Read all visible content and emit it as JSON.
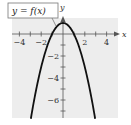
{
  "chart_data": {
    "type": "line",
    "title": "",
    "function_label": "y = f(x)",
    "xlabel": "x",
    "ylabel": "y",
    "xlim": [
      -4.5,
      4.5
    ],
    "ylim": [
      -7.5,
      1.5
    ],
    "x_ticks": [
      -4,
      -3,
      -2,
      -1,
      1,
      2,
      3,
      4
    ],
    "x_tick_labels": [
      "-4",
      "-2",
      "2",
      "4"
    ],
    "x_tick_label_values": [
      -4,
      -2,
      2,
      4
    ],
    "y_ticks": [
      -7,
      -6,
      -5,
      -4,
      -3,
      -2,
      -1,
      1
    ],
    "y_tick_labels": [
      "-2",
      "-4",
      "-6"
    ],
    "y_tick_label_values": [
      -2,
      -4,
      -6
    ],
    "grid": false,
    "series": [
      {
        "name": "y = f(x)",
        "description": "downward-opening parabola, vertex (0, 1), x-intercepts at -1 and 1",
        "x": [
          -2.9,
          -2.5,
          -2,
          -1.5,
          -1,
          -0.5,
          0,
          0.5,
          1,
          1.5,
          2,
          2.5,
          2.9
        ],
        "y": [
          -7.41,
          -5.25,
          -3,
          -1.25,
          0,
          0.75,
          1,
          0.75,
          0,
          -1.25,
          -3,
          -5.25,
          -7.41
        ]
      }
    ],
    "colors": {
      "plot_background": "#ededed",
      "curve": "#111111",
      "axes": "#555555"
    }
  }
}
